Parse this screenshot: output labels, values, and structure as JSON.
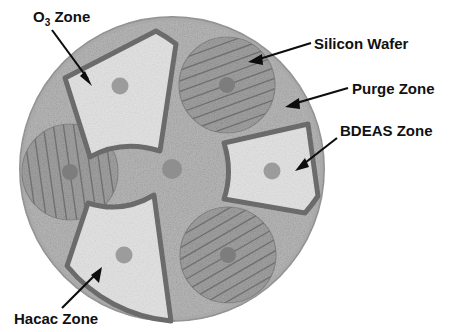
{
  "figure": {
    "background_color": "#ffffff"
  },
  "platen": {
    "name": "reactor-platen",
    "center_x": 172,
    "center_y": 169,
    "radius": 152,
    "fill_color": "#b9b9b9",
    "edge_color": "#9a9a9a",
    "hub_dot_color": "#8f8f8f"
  },
  "zones": [
    {
      "id": "o3",
      "label": "O",
      "label_sub": "3",
      "label_tail": " Zone",
      "full_label": "O3 Zone",
      "angle_deg": 225,
      "fill_color": "#e4e4e4",
      "outline_color": "#6f6f6f",
      "port_dot_color": "#9c9c9c"
    },
    {
      "id": "bdeas",
      "label": "BDEAS Zone",
      "full_label": "BDEAS Zone",
      "angle_deg": 345,
      "fill_color": "#e4e4e4",
      "outline_color": "#6f6f6f",
      "port_dot_color": "#9c9c9c"
    },
    {
      "id": "hacac",
      "label": "Hacac Zone",
      "full_label": "Hacac Zone",
      "angle_deg": 105,
      "fill_color": "#e4e4e4",
      "outline_color": "#6f6f6f",
      "port_dot_color": "#9c9c9c"
    }
  ],
  "wafers": [
    {
      "id": "wafer-top",
      "cx": 227,
      "cy": 85,
      "r": 48,
      "hatch_angle_deg": 70,
      "fill_color": "#a3a3a3",
      "hatch_color": "#6e6e6e",
      "center_dot_color": "#7d7d7d"
    },
    {
      "id": "wafer-left",
      "cx": 70,
      "cy": 172,
      "r": 48,
      "hatch_angle_deg": 172,
      "fill_color": "#a3a3a3",
      "hatch_color": "#6e6e6e",
      "center_dot_color": "#7d7d7d"
    },
    {
      "id": "wafer-bottom",
      "cx": 228,
      "cy": 255,
      "r": 48,
      "hatch_angle_deg": 60,
      "fill_color": "#a3a3a3",
      "hatch_color": "#6e6e6e",
      "center_dot_color": "#7d7d7d"
    }
  ],
  "callouts": [
    {
      "id": "o3-callout",
      "text": "O3 Zone",
      "text_x": 33,
      "text_y": 22,
      "line_x1": 52,
      "line_y1": 30,
      "line_x2": 92,
      "line_y2": 84,
      "arrow_angle_deg": 53
    },
    {
      "id": "silicon-wafer-callout",
      "text": "Silicon Wafer",
      "text_x": 314,
      "text_y": 45,
      "line_x1": 311,
      "line_y1": 43,
      "line_x2": 249,
      "line_y2": 62,
      "arrow_angle_deg": 197
    },
    {
      "id": "purge-zone-callout",
      "text": "Purge Zone",
      "text_x": 352,
      "text_y": 90,
      "line_x1": 348,
      "line_y1": 88,
      "line_x2": 286,
      "line_y2": 106,
      "arrow_angle_deg": 196
    },
    {
      "id": "bdeas-zone-callout",
      "text": "BDEAS Zone",
      "text_x": 340,
      "text_y": 132,
      "line_x1": 337,
      "line_y1": 138,
      "line_x2": 296,
      "line_y2": 170,
      "arrow_angle_deg": 218
    },
    {
      "id": "hacac-zone-callout",
      "text": "Hacac Zone",
      "text_x": 14,
      "text_y": 321,
      "line_x1": 62,
      "line_y1": 308,
      "line_x2": 101,
      "line_y2": 268,
      "arrow_angle_deg": 314
    }
  ],
  "colors": {
    "label_text": "#111111",
    "leader_line": "#0d0d0d"
  }
}
